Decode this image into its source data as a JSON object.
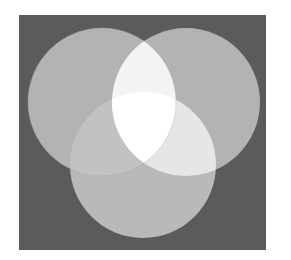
{
  "diagram": {
    "type": "venn",
    "set_count": 3,
    "background": "#ffffff",
    "frame": {
      "x": 19,
      "y": 15,
      "width": 247,
      "height": 235,
      "fill": "#5b5b5b"
    },
    "circles": [
      {
        "id": "top-left",
        "cx": 102,
        "cy": 102,
        "r": 74,
        "fill": "#b3b3b3"
      },
      {
        "id": "top-right",
        "cx": 186,
        "cy": 102,
        "r": 74,
        "fill": "#b3b3b3"
      },
      {
        "id": "bottom",
        "cx": 143,
        "cy": 165,
        "r": 73,
        "fill": "#b9b9b9"
      }
    ],
    "overlap_colors": {
      "top_left_and_top_right": "#f3f3f3",
      "top_left_and_bottom": "#c2c2c2",
      "top_right_and_bottom": "#e6e6e6",
      "all_three": "#ffffff"
    }
  }
}
